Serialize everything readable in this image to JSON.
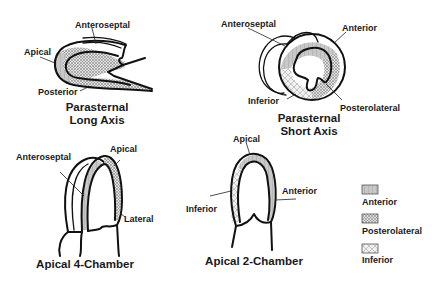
{
  "colors": {
    "ink": "#111111",
    "anterior_fill": "#bdbdbd",
    "posterolateral_fill": "#d9d9d9",
    "inferior_fill": "#eaeaea",
    "background": "#ffffff"
  },
  "views": {
    "plax": {
      "title_line1": "Parasternal",
      "title_line2": "Long Axis",
      "labels": {
        "anteroseptal": "Anteroseptal",
        "apical": "Apical",
        "posterior": "Posterior"
      }
    },
    "psax": {
      "title_line1": "Parasternal",
      "title_line2": "Short Axis",
      "labels": {
        "anteroseptal": "Anteroseptal",
        "anterior": "Anterior",
        "inferior": "Inferior",
        "posterolateral": "Posterolateral"
      }
    },
    "a4c": {
      "title": "Apical 4-Chamber",
      "labels": {
        "anteroseptal": "Anteroseptal",
        "apical": "Apical",
        "lateral": "Lateral"
      }
    },
    "a2c": {
      "title": "Apical 2-Chamber",
      "labels": {
        "apical": "Apical",
        "anterior": "Anterior",
        "inferior": "Inferior"
      }
    }
  },
  "legend": {
    "items": [
      {
        "label": "Anterior",
        "pattern": "light-hatch"
      },
      {
        "label": "Posterolateral",
        "pattern": "dense-crosshatch"
      },
      {
        "label": "Inferior",
        "pattern": "sparse-diamond"
      }
    ]
  }
}
